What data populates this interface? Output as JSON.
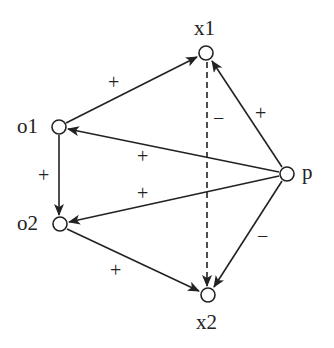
{
  "diagram": {
    "type": "directed-signed-graph",
    "nodes": [
      {
        "id": "x1",
        "label": "x1",
        "x": 206,
        "y": 53
      },
      {
        "id": "o1",
        "label": "o1",
        "x": 59,
        "y": 127
      },
      {
        "id": "p",
        "label": "p",
        "x": 287,
        "y": 174
      },
      {
        "id": "o2",
        "label": "o2",
        "x": 60,
        "y": 224
      },
      {
        "id": "x2",
        "label": "x2",
        "x": 208,
        "y": 295
      }
    ],
    "edges": [
      {
        "from": "o1",
        "to": "x1",
        "sign": "+",
        "style": "solid"
      },
      {
        "from": "p",
        "to": "x1",
        "sign": "+",
        "style": "solid"
      },
      {
        "from": "p",
        "to": "o1",
        "sign": "+",
        "style": "solid"
      },
      {
        "from": "o1",
        "to": "o2",
        "sign": "+",
        "style": "solid"
      },
      {
        "from": "p",
        "to": "o2",
        "sign": "+",
        "style": "solid"
      },
      {
        "from": "o2",
        "to": "x2",
        "sign": "+",
        "style": "solid"
      },
      {
        "from": "p",
        "to": "x2",
        "sign": "−",
        "style": "solid"
      },
      {
        "from": "x1",
        "to": "x2",
        "sign": "−",
        "style": "dashed"
      }
    ]
  },
  "labels": {
    "x1": "x1",
    "o1": "o1",
    "p": "p",
    "o2": "o2",
    "x2": "x2"
  },
  "signs": {
    "o1_x1": "+",
    "p_x1": "+",
    "p_o1": "+",
    "o1_o2": "+",
    "p_o2": "+",
    "o2_x2": "+",
    "p_x2": "−",
    "x1_x2": "−"
  }
}
